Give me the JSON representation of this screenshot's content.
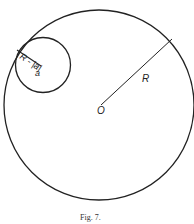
{
  "figure": {
    "caption": "Fig. 7.",
    "labels": {
      "big_radius": "R",
      "center": "O",
      "small_radius": "R - |a|",
      "small_center": "a"
    },
    "colors": {
      "stroke": "#222222",
      "background": "#ffffff"
    }
  }
}
